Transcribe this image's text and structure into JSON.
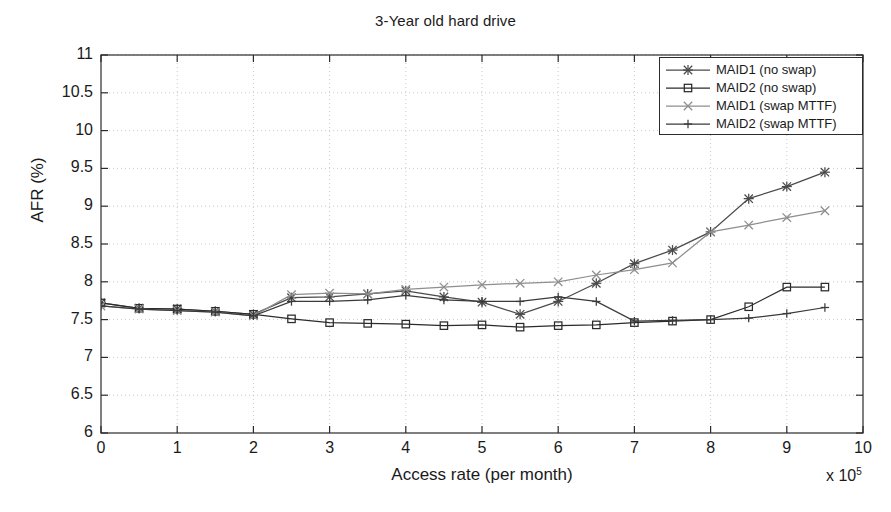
{
  "chart_data": {
    "type": "line",
    "title": "3-Year old hard drive",
    "xlabel": "Access rate (per month)",
    "ylabel": "AFR (%)",
    "x_multiplier": "x 10",
    "x_multiplier_exp": "5",
    "xlim": [
      0,
      10
    ],
    "ylim": [
      6,
      11
    ],
    "xticks": [
      0,
      1,
      2,
      3,
      4,
      5,
      6,
      7,
      8,
      9,
      10
    ],
    "xtick_labels": [
      "0",
      "1",
      "2",
      "3",
      "4",
      "5",
      "6",
      "7",
      "8",
      "9",
      "10"
    ],
    "yticks": [
      6,
      6.5,
      7,
      7.5,
      8,
      8.5,
      9,
      9.5,
      10,
      10.5,
      11
    ],
    "ytick_labels": [
      "6",
      "6.5",
      "7",
      "7.5",
      "8",
      "8.5",
      "9",
      "9.5",
      "10",
      "10.5",
      "11"
    ],
    "grid": true,
    "legend_position": "upper right",
    "x": [
      0,
      0.5,
      1.0,
      1.5,
      2.0,
      2.5,
      3.0,
      3.5,
      4.0,
      4.5,
      5.0,
      5.5,
      6.0,
      6.5,
      7.0,
      7.5,
      8.0,
      8.5,
      9.0,
      9.5
    ],
    "series": [
      {
        "name": "MAID1 (no swap)",
        "marker": "asterisk",
        "color": "#4a4a4a",
        "values": [
          7.72,
          7.65,
          7.64,
          7.61,
          7.57,
          7.79,
          7.8,
          7.84,
          7.88,
          7.8,
          7.73,
          7.57,
          7.74,
          7.98,
          8.24,
          8.42,
          8.66,
          9.1,
          9.26,
          9.45
        ]
      },
      {
        "name": "MAID2 (no swap)",
        "marker": "square",
        "color": "#2b2b2b",
        "values": [
          7.72,
          7.65,
          7.64,
          7.61,
          7.57,
          7.51,
          7.46,
          7.45,
          7.44,
          7.42,
          7.43,
          7.4,
          7.42,
          7.43,
          7.46,
          7.48,
          7.5,
          7.67,
          7.93,
          7.93
        ]
      },
      {
        "name": "MAID1 (swap MTTF)",
        "marker": "x",
        "color": "#8e8e8e",
        "values": [
          7.68,
          7.64,
          7.62,
          7.6,
          7.55,
          7.83,
          7.85,
          7.84,
          7.9,
          7.93,
          7.96,
          7.98,
          8.0,
          8.09,
          8.16,
          8.25,
          8.66,
          8.75,
          8.85,
          8.94
        ]
      },
      {
        "name": "MAID2 (swap MTTF)",
        "marker": "plus",
        "color": "#3a3a3a",
        "values": [
          7.68,
          7.64,
          7.62,
          7.6,
          7.55,
          7.74,
          7.74,
          7.76,
          7.82,
          7.76,
          7.74,
          7.74,
          7.8,
          7.74,
          7.48,
          7.49,
          7.5,
          7.52,
          7.58,
          7.66
        ]
      }
    ]
  }
}
